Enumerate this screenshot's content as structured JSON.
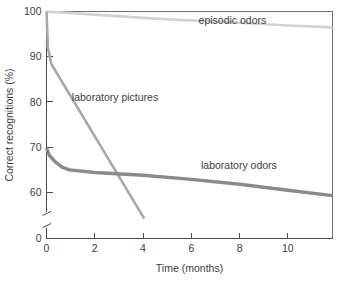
{
  "chart_data": {
    "type": "line",
    "title": "",
    "xlabel": "Time (months)",
    "ylabel": "Correct recognitions (%)",
    "xlim": [
      0,
      11.85
    ],
    "ylim": [
      58,
      100
    ],
    "xticks": [
      0,
      2,
      4,
      6,
      8,
      10
    ],
    "xticklabels": [
      "0",
      "2",
      "4",
      "6",
      "8",
      "10"
    ],
    "yticks": [
      60,
      70,
      80,
      90,
      100
    ],
    "yticklabels": [
      "60",
      "70",
      "80",
      "90",
      "100"
    ],
    "y_axis_break": true,
    "y_origin_label": "0",
    "grid": false,
    "legend_position": "inline-annotations",
    "series": [
      {
        "name": "episodic odors",
        "color": "#d2d2d2",
        "linewidth": 2.6,
        "label_x": 6.3,
        "label_y": 97.2,
        "x": [
          0.0,
          2.0,
          4.0,
          6.0,
          8.0,
          10.0,
          11.85
        ],
        "y": [
          100.0,
          99.3,
          98.6,
          98.0,
          97.5,
          96.9,
          96.5
        ]
      },
      {
        "name": "laboratory pictures",
        "color": "#a8a8a8",
        "linewidth": 2.6,
        "label_x": 1.05,
        "label_y": 80.2,
        "x": [
          0.0,
          0.06,
          0.2,
          4.05
        ],
        "y": [
          100.0,
          92.0,
          88.4,
          54.2
        ]
      },
      {
        "name": "laboratory odors",
        "color": "#8a8a8a",
        "linewidth": 3.4,
        "label_x": 6.4,
        "label_y": 65.2,
        "x": [
          0.0,
          0.12,
          0.35,
          0.65,
          0.95,
          2.0,
          4.0,
          6.0,
          8.0,
          10.0,
          11.85
        ],
        "y": [
          69.8,
          68.2,
          66.8,
          65.6,
          65.0,
          64.4,
          63.8,
          62.9,
          61.8,
          60.5,
          59.3
        ]
      }
    ]
  },
  "axes": {
    "x_title": "Time (months)",
    "y_title": "Correct recognitions (%)"
  },
  "annotations": {
    "episodic_odors": "episodic odors",
    "laboratory_pictures": "laboratory pictures",
    "laboratory_odors": "laboratory odors"
  },
  "colors": {
    "background": "#ffffff",
    "axis": "#4a4a4a",
    "frame": "#6e6e6e",
    "text": "#3d3d3d",
    "episodic_odors": "#d2d2d2",
    "laboratory_pictures": "#a8a8a8",
    "laboratory_odors": "#8a8a8a"
  }
}
